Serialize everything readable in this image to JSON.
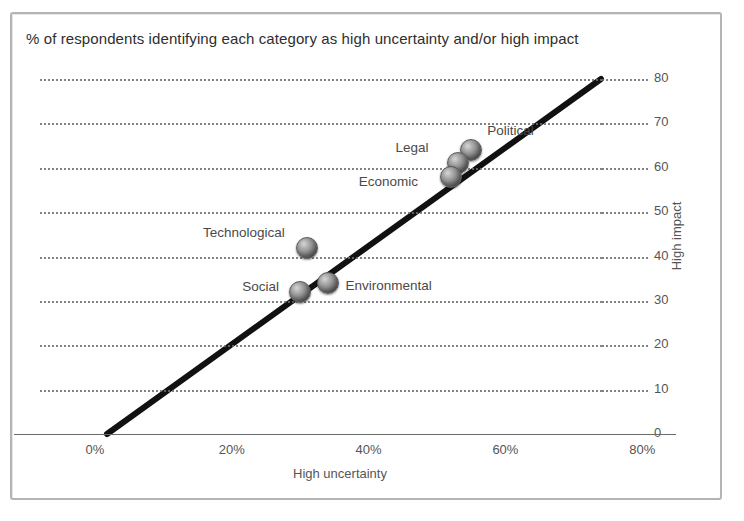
{
  "title": "% of respondents identifying each category as high uncertainty and/or high impact",
  "chart_data": {
    "type": "scatter",
    "title": "% of respondents identifying each category as high uncertainty and/or high impact",
    "xlabel": "High uncertainty",
    "ylabel": "High impact",
    "xlim": [
      0,
      90
    ],
    "ylim": [
      0,
      80
    ],
    "grid": true,
    "legend": "none",
    "xticks": [
      "0%",
      "20%",
      "40%",
      "60%",
      "80%"
    ],
    "xtick_values": [
      0,
      20,
      40,
      60,
      80
    ],
    "yticks": [
      "0",
      "10",
      "20",
      "30",
      "40",
      "50",
      "60",
      "70",
      "80"
    ],
    "ytick_values": [
      0,
      10,
      20,
      30,
      40,
      50,
      60,
      70,
      80
    ],
    "points": [
      {
        "label": "Political",
        "x": 55,
        "y": 64,
        "label_pos": "right"
      },
      {
        "label": "Legal",
        "x": 53,
        "y": 61,
        "label_pos": "left"
      },
      {
        "label": "Economic",
        "x": 52,
        "y": 58,
        "label_pos": "left"
      },
      {
        "label": "Technological",
        "x": 31,
        "y": 42,
        "label_pos": "left"
      },
      {
        "label": "Environmental",
        "x": 34,
        "y": 34,
        "label_pos": "right"
      },
      {
        "label": "Social",
        "x": 30,
        "y": 32,
        "label_pos": "left"
      }
    ],
    "trendline": {
      "x_start": 2,
      "y_start": 0,
      "x_end": 82,
      "y_end": 80
    },
    "annotations": []
  },
  "colors": {
    "frame": "#b4b4b4",
    "grid": "#6e6e6e",
    "axis": "#6a6a6a",
    "marker": "#8c8c8c",
    "text": "#3a3a3a",
    "trendline": "#111111"
  }
}
